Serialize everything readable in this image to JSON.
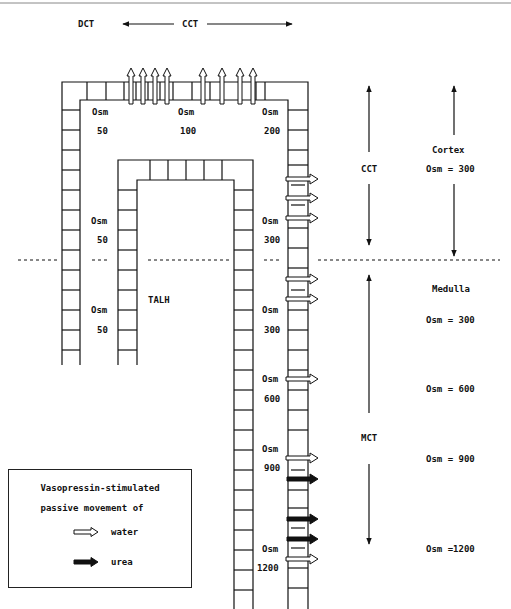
{
  "header": {
    "dct_label": "DCT",
    "cct_label": "CCT"
  },
  "tubule_labels": {
    "cortical": [
      {
        "osm_label": "Osm",
        "value": "50"
      },
      {
        "osm_label": "Osm",
        "value": "100"
      },
      {
        "osm_label": "Osm",
        "value": "200"
      }
    ],
    "mid_left": {
      "osm_label": "Osm",
      "value": "50"
    },
    "mid_right": {
      "osm_label": "Osm",
      "value": "300"
    },
    "talh_label": "TALH",
    "lower_left": {
      "osm_label": "Osm",
      "value": "50"
    },
    "lower_right": {
      "osm_label": "Osm",
      "value": "300"
    },
    "medullary": [
      {
        "osm_label": "Osm",
        "value": "600"
      },
      {
        "osm_label": "Osm",
        "value": "900"
      },
      {
        "osm_label": "Osm",
        "value": "1200"
      }
    ]
  },
  "segments": {
    "cct": "CCT",
    "mct": "MCT"
  },
  "zones": {
    "cortex": {
      "name": "Cortex",
      "osm": "Osm = 300"
    },
    "medulla": {
      "name": "Medulla",
      "levels": [
        "Osm = 300",
        "Osm = 600",
        "Osm = 900",
        "Osm =1200"
      ]
    }
  },
  "legend": {
    "title_line1": "Vasopressin-stimulated",
    "title_line2": "passive movement of",
    "items": [
      {
        "label": "water",
        "arrow": "hollow-arrow"
      },
      {
        "label": "urea",
        "arrow": "solid-arrow"
      }
    ]
  },
  "colors": {
    "line": "#111111",
    "background": "#ffffff",
    "top_rule": "#888888"
  }
}
